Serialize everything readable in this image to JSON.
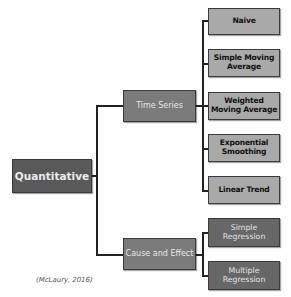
{
  "diagram": {
    "root": {
      "label": "Quantitative"
    },
    "branches": [
      {
        "label": "Time Series",
        "children": [
          {
            "label": "Naive"
          },
          {
            "label": "Simple Moving Average"
          },
          {
            "label": "Weighted Moving Average"
          },
          {
            "label": "Exponential Smoothing"
          },
          {
            "label": "Linear Trend"
          }
        ]
      },
      {
        "label": "Cause and Effect",
        "children": [
          {
            "label": "Simple Regression"
          },
          {
            "label": "Multiple Regression"
          }
        ]
      }
    ],
    "citation": "(McLaury, 2016)"
  },
  "colors": {
    "root_fill": "#595959",
    "branch_fill": "#7b7b7b",
    "time_series_leaf_fill": "#a9a9a9",
    "regression_leaf_fill": "#676767",
    "connector": "#222222"
  }
}
